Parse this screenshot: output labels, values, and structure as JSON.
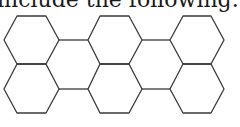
{
  "caption": "include the following.",
  "diagram": {
    "type": "hexagon-tessellation",
    "stroke_color": "#3a3a3a",
    "rows": 2,
    "columns": 3,
    "hexagon_count_outlined": 6
  }
}
